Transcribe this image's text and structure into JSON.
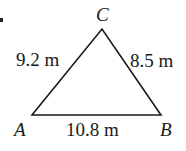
{
  "diagram": {
    "type": "triangle",
    "vertices": {
      "A": {
        "label": "A",
        "x": 32,
        "y": 115
      },
      "B": {
        "label": "B",
        "x": 161,
        "y": 115
      },
      "C": {
        "label": "C",
        "x": 102,
        "y": 29
      }
    },
    "sides": {
      "AC": {
        "label": "9.2 m"
      },
      "BC": {
        "label": "8.5 m"
      },
      "AB": {
        "label": "10.8 m"
      }
    },
    "stroke_color": "#1a1a1a"
  }
}
